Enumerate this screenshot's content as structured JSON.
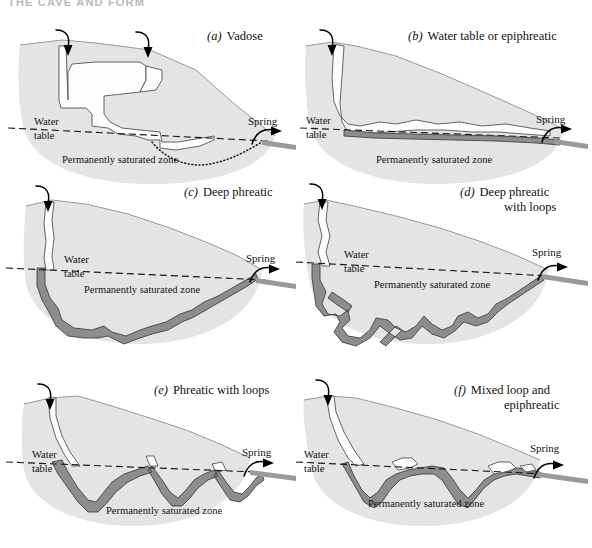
{
  "page": {
    "header": "THE CAVE AND FORM"
  },
  "common": {
    "water_table_label_line1": "Water",
    "water_table_label_line2": "table",
    "saturated_zone_label": "Permanently saturated zone",
    "spring_label": "Spring",
    "sink_icon": "sink-arrow-icon",
    "spring_icon": "spring-arrow-icon"
  },
  "colors": {
    "rock_fill": "#e4e4e4",
    "rock_outline": "#8e8e8e",
    "void_fill": "#fdfdfd",
    "void_outline": "#4a4a4a",
    "conduit_fill": "#8d8d8d",
    "conduit_outline": "#3c3c3c",
    "water_table_line": "#1a1a1a",
    "background": "#ffffff",
    "header_text": "#b9b9bd"
  },
  "panels": [
    {
      "key": "a",
      "letter": "(a)",
      "title": "Vadose",
      "title_line2": "",
      "description": "Stepped vadose canyon descending from two sinks, perched above the water table, with a dotted projected route dipping below the water table to the spring.",
      "has_dotted_route": true,
      "sinks": 2,
      "conduit_style": "vadose-stepped-void",
      "water_table": "dashed-sloping"
    },
    {
      "key": "b",
      "letter": "(b)",
      "title": "Water table or epiphreatic",
      "title_line2": "",
      "description": "Passage descends steeply from the sink then follows the water table closely as an undulating epiphreatic tube to the spring.",
      "has_dotted_route": false,
      "sinks": 1,
      "conduit_style": "water-table-tube",
      "water_table": "dashed-sloping"
    },
    {
      "key": "c",
      "letter": "(c)",
      "title": "Deep phreatic",
      "title_line2": "",
      "description": "A single deep phreatic loop plunging far below the water table and rising in steps to the spring.",
      "has_dotted_route": false,
      "sinks": 1,
      "conduit_style": "deep-single-loop",
      "water_table": "dashed-sloping"
    },
    {
      "key": "d",
      "letter": "(d)",
      "title": "Deep phreatic",
      "title_line2": "with loops",
      "description": "Deep phreatic conduit with multiple branching loops and pendant side passages below the water table.",
      "has_dotted_route": false,
      "sinks": 1,
      "conduit_style": "deep-multi-loop",
      "water_table": "dashed-sloping"
    },
    {
      "key": "e",
      "letter": "(e)",
      "title": "Phreatic with loops",
      "title_line2": "",
      "description": "A series of shallow V-shaped phreatic loops hanging below the water table, with crests touching it.",
      "has_dotted_route": false,
      "sinks": 1,
      "conduit_style": "shallow-loops",
      "water_table": "dashed-sloping"
    },
    {
      "key": "f",
      "letter": "(f)",
      "title": "Mixed loop and",
      "title_line2": "epiphreatic",
      "description": "Mixture of shallow loops and epiphreatic water-table segments alternating along the route to the spring.",
      "has_dotted_route": false,
      "sinks": 1,
      "conduit_style": "mixed-loop-epiphreatic",
      "water_table": "dashed-sloping"
    }
  ]
}
